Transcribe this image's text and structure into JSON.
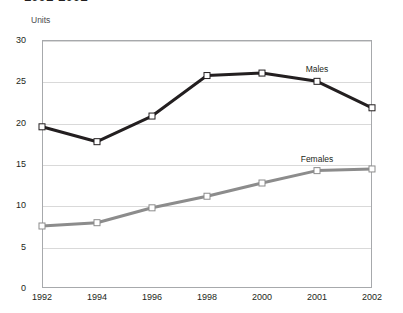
{
  "title": "1992-2002",
  "axis": {
    "y_label": "Units",
    "y_ticks": [
      "0",
      "5",
      "10",
      "15",
      "20",
      "25",
      "30"
    ],
    "x_ticks": [
      "1992",
      "1994",
      "1996",
      "1998",
      "2000",
      "2001",
      "2002"
    ]
  },
  "labels": {
    "males": "Males",
    "females": "Females"
  },
  "colors": {
    "males_line": "#231f20",
    "females_line": "#8c8c8c",
    "grid": "#d9d9d9",
    "border": "#a7a9ac",
    "marker_fill": "#ffffff"
  },
  "chart_data": {
    "type": "line",
    "title": "1992-2002",
    "xlabel": "",
    "ylabel": "Units",
    "ylim": [
      0,
      30
    ],
    "yticks": [
      0,
      5,
      10,
      15,
      20,
      25,
      30
    ],
    "grid": true,
    "legend": "inline-labels",
    "categories": [
      "1992",
      "1994",
      "1996",
      "1998",
      "2000",
      "2001",
      "2002"
    ],
    "series": [
      {
        "name": "Males",
        "color": "#231f20",
        "values": [
          19.5,
          17.7,
          20.8,
          25.7,
          26.0,
          25.0,
          21.8
        ]
      },
      {
        "name": "Females",
        "color": "#8c8c8c",
        "values": [
          7.5,
          7.9,
          9.7,
          11.1,
          12.7,
          14.2,
          14.4
        ]
      }
    ]
  }
}
